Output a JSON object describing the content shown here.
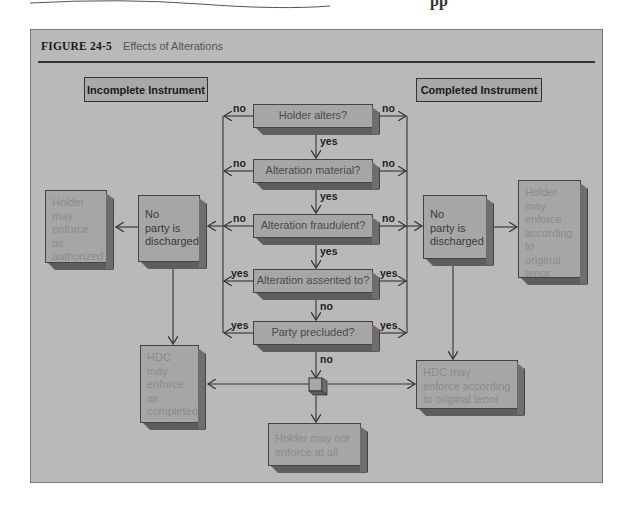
{
  "page": {
    "top_partial_text": "pp"
  },
  "figure": {
    "number": "FIGURE  24-5",
    "title": "Effects of Alterations"
  },
  "columns": {
    "left_label": "Incomplete Instrument",
    "right_label": "Completed Instrument"
  },
  "decisions": [
    {
      "id": "d1",
      "text": "Holder alters?",
      "left_edge": "no",
      "right_edge": "no",
      "down_edge": "yes"
    },
    {
      "id": "d2",
      "text": "Alteration material?",
      "left_edge": "no",
      "right_edge": "no",
      "down_edge": "yes"
    },
    {
      "id": "d3",
      "text": "Alteration fraudulent?",
      "left_edge": "no",
      "right_edge": "no",
      "down_edge": "yes"
    },
    {
      "id": "d4",
      "text": "Alteration assented to?",
      "left_edge": "yes",
      "right_edge": "yes",
      "down_edge": "no"
    },
    {
      "id": "d5",
      "text": "Party precluded?",
      "left_edge": "yes",
      "right_edge": "yes",
      "down_edge": "no"
    }
  ],
  "outcomes": {
    "left_no_party": "No\nparty is\ndischarged",
    "left_holder_authorized": "Holder\nmay\nenforce\nas\nauthorized",
    "right_no_party": "No\nparty is\ndischarged",
    "right_holder_original": "Holder\nmay\nenforce\naccording\nto\noriginal\ntenor",
    "left_hdc": "HDC\nmay\nenforce\nas\ncompleted",
    "right_hdc": "HDC may\nenforce according\nto original tenor",
    "holder_not_enforce": "Holder may not\nenforce at all"
  },
  "colors": {
    "figure_bg": "#b9b9b9",
    "box_face": "#a6a6a6",
    "box_side": "#6e6e6e",
    "line": "#333333"
  }
}
